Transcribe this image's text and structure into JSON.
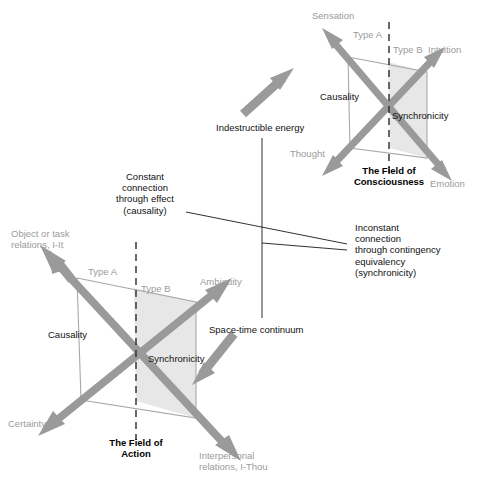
{
  "diagram": {
    "title_implicit": "Causality and Synchronicity: Field of Consciousness and Field of Action",
    "colors": {
      "arrow_gray": "#9a9a9a",
      "shade_gray": "#e7e7e7",
      "label_gray": "#9b9b9b",
      "line_dark": "#1a1a1a",
      "text_black": "#111111",
      "frame_gray": "#a8a8a8"
    },
    "upper_field": {
      "caption": "The Field of\nConsciousness",
      "axis_labels": {
        "top_left": "Sensation",
        "top_right": "Intuition",
        "bottom_left": "Thought",
        "bottom_right": "Emotion"
      },
      "type_a": "Type A",
      "type_b": "Type B",
      "causality": "Causality",
      "synchronicity": "Synchronicity"
    },
    "lower_field": {
      "caption": "The Field of\nAction",
      "axis_labels": {
        "top_left": "Object or task\nrelations, I-It",
        "top_right": "Ambiguity",
        "bottom_left": "Certainty",
        "bottom_right": "Interpersonal\nrelations, I-Thou"
      },
      "type_a": "Type A",
      "type_b": "Type B",
      "causality": "Causality",
      "synchronicity": "Synchronicity"
    },
    "annotations": {
      "indestructible_energy": "Indestructible energy",
      "space_time_continuum": "Space-time continuum",
      "constant_connection": "Constant\nconnection\nthrough effect\n(causality)",
      "inconstant_connection": "Inconstant\nconnection\nthrough contingency\nequivalency\n(synchronicity)"
    }
  }
}
